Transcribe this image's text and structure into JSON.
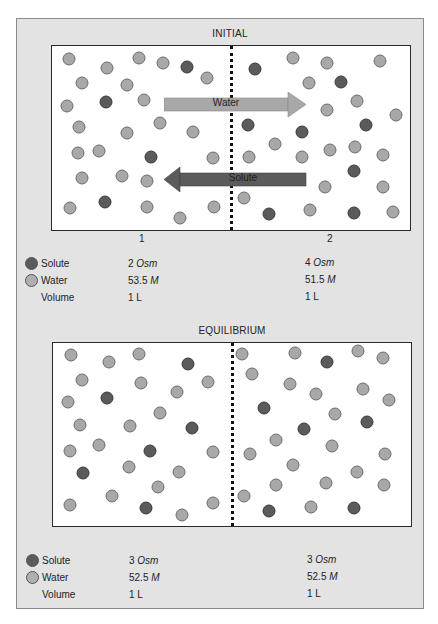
{
  "colors": {
    "panel_bg": "#e3e3e3",
    "box_bg": "#ffffff",
    "water": "#a8a8a8",
    "solute": "#5b5b5b",
    "water_arrow": "#a8a8a8",
    "solute_arrow": "#5b5b5b"
  },
  "initial": {
    "title": "INITIAL",
    "compartment_labels": [
      "1",
      "2"
    ],
    "arrows": {
      "water": "Water",
      "solute": "Solute"
    },
    "legend": {
      "solute_label": "Solute",
      "water_label": "Water",
      "volume_label": "Volume"
    },
    "compartment1": {
      "solute_value": "2",
      "solute_unit": "Osm",
      "water_value": "53.5",
      "water_unit": "M",
      "volume": "1 L"
    },
    "compartment2": {
      "solute_value": "4",
      "solute_unit": "Osm",
      "water_value": "51.5",
      "water_unit": "M",
      "volume": "1 L"
    },
    "particles": [
      {
        "x": 69,
        "y": 59,
        "t": "water"
      },
      {
        "x": 107,
        "y": 68,
        "t": "water"
      },
      {
        "x": 139,
        "y": 58,
        "t": "water"
      },
      {
        "x": 163,
        "y": 63,
        "t": "water"
      },
      {
        "x": 187,
        "y": 67,
        "t": "solute"
      },
      {
        "x": 207,
        "y": 78,
        "t": "water"
      },
      {
        "x": 82,
        "y": 83,
        "t": "water"
      },
      {
        "x": 127,
        "y": 85,
        "t": "water"
      },
      {
        "x": 67,
        "y": 106,
        "t": "water"
      },
      {
        "x": 106,
        "y": 102,
        "t": "solute"
      },
      {
        "x": 144,
        "y": 100,
        "t": "water"
      },
      {
        "x": 79,
        "y": 127,
        "t": "water"
      },
      {
        "x": 127,
        "y": 133,
        "t": "water"
      },
      {
        "x": 160,
        "y": 123,
        "t": "water"
      },
      {
        "x": 193,
        "y": 132,
        "t": "water"
      },
      {
        "x": 78,
        "y": 153,
        "t": "water"
      },
      {
        "x": 99,
        "y": 151,
        "t": "water"
      },
      {
        "x": 151,
        "y": 157,
        "t": "solute"
      },
      {
        "x": 213,
        "y": 158,
        "t": "water"
      },
      {
        "x": 82,
        "y": 178,
        "t": "water"
      },
      {
        "x": 122,
        "y": 176,
        "t": "water"
      },
      {
        "x": 147,
        "y": 181,
        "t": "water"
      },
      {
        "x": 70,
        "y": 208,
        "t": "water"
      },
      {
        "x": 105,
        "y": 202,
        "t": "solute"
      },
      {
        "x": 147,
        "y": 207,
        "t": "water"
      },
      {
        "x": 180,
        "y": 218,
        "t": "water"
      },
      {
        "x": 214,
        "y": 207,
        "t": "water"
      },
      {
        "x": 255,
        "y": 69,
        "t": "solute"
      },
      {
        "x": 293,
        "y": 58,
        "t": "water"
      },
      {
        "x": 327,
        "y": 63,
        "t": "water"
      },
      {
        "x": 380,
        "y": 61,
        "t": "water"
      },
      {
        "x": 309,
        "y": 83,
        "t": "water"
      },
      {
        "x": 341,
        "y": 82,
        "t": "solute"
      },
      {
        "x": 327,
        "y": 110,
        "t": "water"
      },
      {
        "x": 357,
        "y": 101,
        "t": "water"
      },
      {
        "x": 396,
        "y": 115,
        "t": "water"
      },
      {
        "x": 248,
        "y": 125,
        "t": "solute"
      },
      {
        "x": 302,
        "y": 132,
        "t": "solute"
      },
      {
        "x": 366,
        "y": 125,
        "t": "solute"
      },
      {
        "x": 275,
        "y": 144,
        "t": "water"
      },
      {
        "x": 249,
        "y": 157,
        "t": "water"
      },
      {
        "x": 302,
        "y": 157,
        "t": "water"
      },
      {
        "x": 330,
        "y": 150,
        "t": "water"
      },
      {
        "x": 355,
        "y": 147,
        "t": "water"
      },
      {
        "x": 383,
        "y": 155,
        "t": "water"
      },
      {
        "x": 354,
        "y": 171,
        "t": "solute"
      },
      {
        "x": 325,
        "y": 187,
        "t": "water"
      },
      {
        "x": 383,
        "y": 187,
        "t": "water"
      },
      {
        "x": 244,
        "y": 198,
        "t": "water"
      },
      {
        "x": 269,
        "y": 214,
        "t": "solute"
      },
      {
        "x": 310,
        "y": 210,
        "t": "water"
      },
      {
        "x": 354,
        "y": 213,
        "t": "solute"
      },
      {
        "x": 393,
        "y": 212,
        "t": "water"
      }
    ]
  },
  "equilibrium": {
    "title": "EQUILIBRIUM",
    "legend": {
      "solute_label": "Solute",
      "water_label": "Water",
      "volume_label": "Volume"
    },
    "compartment1": {
      "solute_value": "3",
      "solute_unit": "Osm",
      "water_value": "52.5",
      "water_unit": "M",
      "volume": "1 L"
    },
    "compartment2": {
      "solute_value": "3",
      "solute_unit": "Osm",
      "water_value": "52.5",
      "water_unit": "M",
      "volume": "1 L"
    },
    "particles": [
      {
        "x": 71,
        "y": 355,
        "t": "water"
      },
      {
        "x": 109,
        "y": 362,
        "t": "water"
      },
      {
        "x": 139,
        "y": 354,
        "t": "water"
      },
      {
        "x": 188,
        "y": 364,
        "t": "solute"
      },
      {
        "x": 82,
        "y": 380,
        "t": "water"
      },
      {
        "x": 141,
        "y": 383,
        "t": "water"
      },
      {
        "x": 177,
        "y": 392,
        "t": "water"
      },
      {
        "x": 208,
        "y": 382,
        "t": "water"
      },
      {
        "x": 68,
        "y": 402,
        "t": "water"
      },
      {
        "x": 107,
        "y": 398,
        "t": "solute"
      },
      {
        "x": 160,
        "y": 413,
        "t": "water"
      },
      {
        "x": 80,
        "y": 425,
        "t": "water"
      },
      {
        "x": 130,
        "y": 426,
        "t": "water"
      },
      {
        "x": 192,
        "y": 428,
        "t": "solute"
      },
      {
        "x": 70,
        "y": 451,
        "t": "water"
      },
      {
        "x": 99,
        "y": 445,
        "t": "water"
      },
      {
        "x": 150,
        "y": 451,
        "t": "solute"
      },
      {
        "x": 213,
        "y": 452,
        "t": "water"
      },
      {
        "x": 83,
        "y": 473,
        "t": "solute"
      },
      {
        "x": 129,
        "y": 467,
        "t": "water"
      },
      {
        "x": 179,
        "y": 472,
        "t": "water"
      },
      {
        "x": 158,
        "y": 487,
        "t": "water"
      },
      {
        "x": 112,
        "y": 496,
        "t": "water"
      },
      {
        "x": 70,
        "y": 505,
        "t": "water"
      },
      {
        "x": 146,
        "y": 508,
        "t": "solute"
      },
      {
        "x": 182,
        "y": 515,
        "t": "water"
      },
      {
        "x": 213,
        "y": 503,
        "t": "water"
      },
      {
        "x": 242,
        "y": 354,
        "t": "water"
      },
      {
        "x": 295,
        "y": 353,
        "t": "water"
      },
      {
        "x": 327,
        "y": 362,
        "t": "solute"
      },
      {
        "x": 358,
        "y": 351,
        "t": "water"
      },
      {
        "x": 383,
        "y": 358,
        "t": "water"
      },
      {
        "x": 252,
        "y": 374,
        "t": "water"
      },
      {
        "x": 290,
        "y": 384,
        "t": "water"
      },
      {
        "x": 316,
        "y": 394,
        "t": "water"
      },
      {
        "x": 363,
        "y": 389,
        "t": "water"
      },
      {
        "x": 389,
        "y": 400,
        "t": "water"
      },
      {
        "x": 264,
        "y": 408,
        "t": "solute"
      },
      {
        "x": 335,
        "y": 414,
        "t": "water"
      },
      {
        "x": 367,
        "y": 422,
        "t": "solute"
      },
      {
        "x": 304,
        "y": 429,
        "t": "solute"
      },
      {
        "x": 276,
        "y": 440,
        "t": "water"
      },
      {
        "x": 332,
        "y": 446,
        "t": "water"
      },
      {
        "x": 250,
        "y": 454,
        "t": "water"
      },
      {
        "x": 385,
        "y": 454,
        "t": "water"
      },
      {
        "x": 293,
        "y": 465,
        "t": "water"
      },
      {
        "x": 357,
        "y": 472,
        "t": "water"
      },
      {
        "x": 276,
        "y": 485,
        "t": "water"
      },
      {
        "x": 326,
        "y": 483,
        "t": "water"
      },
      {
        "x": 384,
        "y": 485,
        "t": "water"
      },
      {
        "x": 244,
        "y": 496,
        "t": "water"
      },
      {
        "x": 269,
        "y": 511,
        "t": "solute"
      },
      {
        "x": 311,
        "y": 507,
        "t": "water"
      },
      {
        "x": 354,
        "y": 508,
        "t": "solute"
      }
    ]
  }
}
